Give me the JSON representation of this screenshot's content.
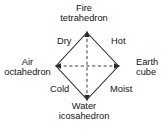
{
  "diagram": {
    "shape": "diamond",
    "stroke_color": "#2b2b2b",
    "background_color": "#ffffff",
    "vertices": [
      {
        "position": "top",
        "element": "Fire",
        "solid": "tetrahedron",
        "arrow": "up"
      },
      {
        "position": "right",
        "element": "Earth",
        "solid": "cube",
        "arrow": "right"
      },
      {
        "position": "bottom",
        "element": "Water",
        "solid": "icosahedron",
        "arrow": "down"
      },
      {
        "position": "left",
        "element": "Air",
        "solid": "octahedron",
        "arrow": "left"
      }
    ],
    "qualities": [
      {
        "position": "upper-left",
        "label": "Dry"
      },
      {
        "position": "upper-right",
        "label": "Hot"
      },
      {
        "position": "lower-left",
        "label": "Cold"
      },
      {
        "position": "lower-right",
        "label": "Moist"
      }
    ]
  }
}
